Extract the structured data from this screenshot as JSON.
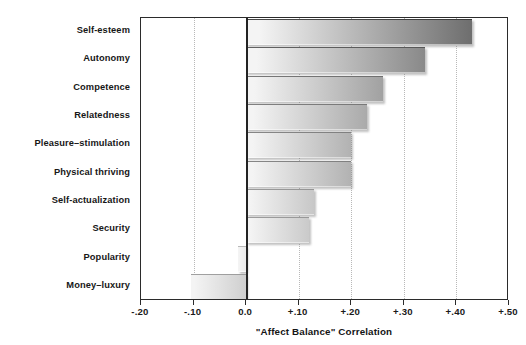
{
  "chart_data": {
    "type": "bar",
    "orientation": "horizontal",
    "title": "",
    "xlabel": "\"Affect Balance\" Correlation",
    "ylabel": "",
    "xlim": [
      -0.2,
      0.5
    ],
    "xticks": [
      -0.2,
      -0.1,
      0.0,
      0.1,
      0.2,
      0.3,
      0.4,
      0.5
    ],
    "xticklabels": [
      "-.20",
      "-.10",
      "0.0",
      "+.10",
      "+.20",
      "+.30",
      "+.40",
      "+.50"
    ],
    "grid": "vertical-dotted",
    "legend": "none",
    "zero_reference_line": 0.0,
    "categories": [
      "Self-esteem",
      "Autonomy",
      "Competence",
      "Relatedness",
      "Pleasure–stimulation",
      "Physical thriving",
      "Self-actualization",
      "Security",
      "Popularity",
      "Money–luxury"
    ],
    "values": [
      0.43,
      0.34,
      0.26,
      0.23,
      0.2,
      0.2,
      0.13,
      0.12,
      -0.015,
      -0.105
    ],
    "bar_style": {
      "fill": "horizontal-gradient-gray",
      "gradient_start": "#eeeeee",
      "gradient_end": "#6f6f6f",
      "edge": "#4a4a4a"
    }
  },
  "axis": {
    "frame_color": "#2b2b2b",
    "gridline_color": "#b8b8b8",
    "zeroline_color": "#232323"
  }
}
